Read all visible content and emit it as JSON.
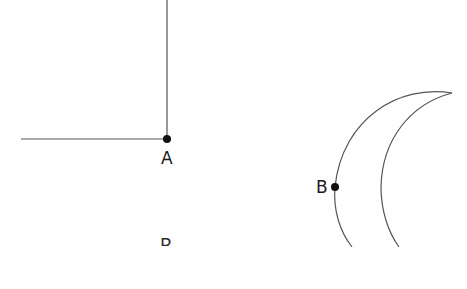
{
  "diagram": {
    "type": "geometry-figure",
    "colors": {
      "stroke": "#555555",
      "point": "#111111",
      "text": "#1a1a1a",
      "background": "#ffffff"
    },
    "points": [
      {
        "id": "A",
        "label": "A",
        "x": 167,
        "y": 139
      },
      {
        "id": "B",
        "label": "B",
        "x": 335,
        "y": 187
      }
    ],
    "clipped_label": "B",
    "shapes": [
      {
        "kind": "right-angle-lines",
        "description": "vertical line up from A and horizontal line left from A"
      },
      {
        "kind": "crescent",
        "description": "two arcs meeting at a pointed tip upper right, B on outer arc"
      }
    ]
  }
}
